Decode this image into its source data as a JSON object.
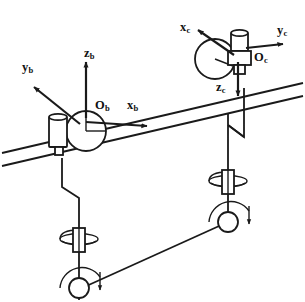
{
  "figure": {
    "type": "kinematic-diagram",
    "background_color": "#ffffff",
    "line_color": "#1a1a1a",
    "canvas": {
      "width": 305,
      "height": 302
    }
  },
  "frames": [
    {
      "id": "frame-b",
      "origin_label": "O",
      "origin_subscript": "b",
      "origin_px": {
        "x": 86,
        "y": 118
      },
      "axes": [
        {
          "name": "x-axis-b",
          "label": "x",
          "subscript": "b",
          "direction": "right",
          "tip_px": {
            "x": 150,
            "y": 122
          }
        },
        {
          "name": "y-axis-b",
          "label": "y",
          "subscript": "b",
          "direction": "up-left",
          "tip_px": {
            "x": 33,
            "y": 86
          }
        },
        {
          "name": "z-axis-b",
          "label": "z",
          "subscript": "b",
          "direction": "up",
          "tip_px": {
            "x": 86,
            "y": 61
          }
        }
      ]
    },
    {
      "id": "frame-c",
      "origin_label": "O",
      "origin_subscript": "c",
      "origin_px": {
        "x": 238,
        "y": 60
      },
      "axes": [
        {
          "name": "x-axis-c",
          "label": "x",
          "subscript": "c",
          "direction": "up-left",
          "tip_px": {
            "x": 196,
            "y": 30
          }
        },
        {
          "name": "y-axis-c",
          "label": "y",
          "subscript": "c",
          "direction": "right",
          "tip_px": {
            "x": 284,
            "y": 44
          }
        },
        {
          "name": "z-axis-c",
          "label": "z",
          "subscript": "c",
          "direction": "down",
          "tip_px": {
            "x": 238,
            "y": 97
          }
        }
      ]
    }
  ],
  "labels": {
    "x_b": "x",
    "x_b_sub": "b",
    "y_b": "y",
    "y_b_sub": "b",
    "z_b": "z",
    "z_b_sub": "b",
    "O_b": "O",
    "O_b_sub": "b",
    "x_c": "x",
    "x_c_sub": "c",
    "y_c": "y",
    "y_c_sub": "c",
    "z_c": "z",
    "z_c_sub": "c",
    "O_c": "O",
    "O_c_sub": "c"
  },
  "components": {
    "rail": {
      "name": "inclined-guide-rail",
      "line_count": 2,
      "left_px": {
        "x": 2,
        "y": 160
      },
      "right_px": {
        "x": 303,
        "y": 90
      }
    },
    "carriage_b": {
      "name": "spherical-joint-carriage-b",
      "sphere_center_px": {
        "x": 86,
        "y": 131
      },
      "sphere_radius": 20
    },
    "carriage_c": {
      "name": "spherical-joint-carriage-c",
      "sphere_center_px": {
        "x": 215,
        "y": 59
      },
      "sphere_radius": 20
    },
    "link_left": {
      "name": "left-vertical-link-with-offset"
    },
    "link_right": {
      "name": "right-vertical-link-with-offset"
    },
    "joint_left_prismatic": {
      "name": "left-rotary-joint-upper"
    },
    "joint_left_revolute": {
      "name": "left-revolute-joint-lower"
    },
    "joint_right_prismatic": {
      "name": "right-rotary-joint-upper"
    },
    "joint_right_revolute": {
      "name": "right-revolute-joint-lower"
    },
    "coupler": {
      "name": "lower-coupler-link"
    }
  }
}
